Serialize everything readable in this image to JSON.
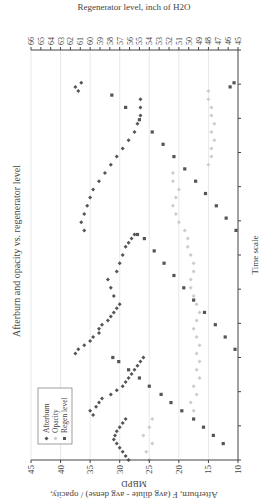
{
  "chart_data": {
    "type": "scatter",
    "title": "Afterburn and opacity vs. regenerator level",
    "xlabel": "Time scale",
    "ylabel": "Afterburn, F (avg dilute - avg dense) / opacity, MBPD",
    "y2label": "Regenerator level, inch of H2O",
    "ylim": [
      10,
      45
    ],
    "y_ticks": [
      10,
      15,
      20,
      25,
      30,
      35,
      40,
      45
    ],
    "y2lim": [
      45,
      66
    ],
    "y2_ticks": [
      45,
      46,
      47,
      48,
      49,
      50,
      51,
      52,
      53,
      54,
      55,
      56,
      57,
      58,
      59,
      60,
      61,
      62,
      63,
      64,
      65,
      66
    ],
    "xlim": [
      0,
      100
    ],
    "x_tick_count": 12,
    "grid": "vertical lines at left-axis ticks",
    "legend": {
      "position": "upper-left inside plot",
      "entries": [
        "Afterburn",
        "Opacity",
        "Regen level"
      ]
    },
    "rotation": "figure rotated 90 degrees counter-clockwise on page",
    "series": [
      {
        "name": "Afterburn",
        "axis": "left",
        "marker": "diamond",
        "color": "#555555",
        "points": [
          [
            0,
            28.5
          ],
          [
            1,
            29
          ],
          [
            2,
            29.5
          ],
          [
            3,
            30
          ],
          [
            4,
            30.5
          ],
          [
            5,
            31
          ],
          [
            6,
            30.8
          ],
          [
            7,
            30.5
          ],
          [
            8,
            30
          ],
          [
            9,
            29.5
          ],
          [
            10,
            29
          ],
          [
            11,
            34.5
          ],
          [
            12,
            35
          ],
          [
            13,
            34
          ],
          [
            14,
            33.5
          ],
          [
            15,
            33
          ],
          [
            16,
            31.5
          ],
          [
            17,
            30.5
          ],
          [
            18,
            29.5
          ],
          [
            19,
            29
          ],
          [
            20,
            28.5
          ],
          [
            21,
            28
          ],
          [
            22,
            27.5
          ],
          [
            23,
            27
          ],
          [
            24,
            26.5
          ],
          [
            25,
            26
          ],
          [
            26,
            37.5
          ],
          [
            27,
            37
          ],
          [
            28,
            36
          ],
          [
            29,
            35
          ],
          [
            30,
            34.5
          ],
          [
            31,
            33.5
          ],
          [
            32,
            33.5
          ],
          [
            33,
            33
          ],
          [
            34,
            32
          ],
          [
            35,
            31.5
          ],
          [
            36,
            31
          ],
          [
            37,
            30.5
          ],
          [
            38,
            30
          ],
          [
            40,
            31
          ],
          [
            42,
            31.5
          ],
          [
            44,
            32
          ],
          [
            46,
            30.5
          ],
          [
            48,
            30
          ],
          [
            50,
            29.5
          ],
          [
            52,
            29
          ],
          [
            53,
            28.5
          ],
          [
            54,
            28
          ],
          [
            55,
            27.5
          ],
          [
            56,
            36
          ],
          [
            58,
            36.5
          ],
          [
            60,
            36
          ],
          [
            62,
            35.5
          ],
          [
            64,
            35
          ],
          [
            66,
            34.5
          ],
          [
            68,
            33.5
          ],
          [
            70,
            32.5
          ],
          [
            72,
            31.5
          ],
          [
            74,
            30.5
          ],
          [
            76,
            29.5
          ],
          [
            78,
            28.5
          ],
          [
            80,
            27.5
          ],
          [
            82,
            27
          ],
          [
            84,
            26.5
          ],
          [
            86,
            26.5
          ],
          [
            88,
            26.5
          ],
          [
            90,
            37
          ],
          [
            91,
            37.5
          ],
          [
            92,
            36.5
          ]
        ]
      },
      {
        "name": "Opacity",
        "axis": "left",
        "marker": "diamond",
        "color": "#cccccc",
        "points": [
          [
            0,
            25
          ],
          [
            2,
            25.5
          ],
          [
            4,
            24.5
          ],
          [
            6,
            26
          ],
          [
            8,
            25
          ],
          [
            10,
            24.5
          ],
          [
            12,
            17.5
          ],
          [
            14,
            18
          ],
          [
            16,
            17
          ],
          [
            18,
            17.5
          ],
          [
            20,
            16.5
          ],
          [
            22,
            17
          ],
          [
            24,
            16.5
          ],
          [
            26,
            17
          ],
          [
            28,
            16.5
          ],
          [
            30,
            17
          ],
          [
            32,
            17.5
          ],
          [
            34,
            17
          ],
          [
            36,
            16.5
          ],
          [
            38,
            17
          ],
          [
            40,
            17.5
          ],
          [
            42,
            18
          ],
          [
            44,
            18
          ],
          [
            46,
            17.5
          ],
          [
            48,
            17.5
          ],
          [
            50,
            18
          ],
          [
            52,
            18.5
          ],
          [
            54,
            18.5
          ],
          [
            56,
            19
          ],
          [
            58,
            20
          ],
          [
            60,
            20.5
          ],
          [
            62,
            21
          ],
          [
            64,
            20.5
          ],
          [
            66,
            20
          ],
          [
            68,
            21
          ],
          [
            70,
            21
          ],
          [
            72,
            15
          ],
          [
            74,
            14.5
          ],
          [
            76,
            14.5
          ],
          [
            78,
            14
          ],
          [
            80,
            14.5
          ],
          [
            82,
            14
          ],
          [
            84,
            14.5
          ],
          [
            86,
            14.5
          ],
          [
            88,
            15
          ],
          [
            90,
            15
          ]
        ]
      },
      {
        "name": "Regen level",
        "axis": "right",
        "marker": "square",
        "color": "#555555",
        "points": [
          [
            4,
            46.5
          ],
          [
            6,
            47.5
          ],
          [
            8,
            48.5
          ],
          [
            10,
            49.5
          ],
          [
            12,
            50.7
          ],
          [
            14,
            51.8
          ],
          [
            16,
            52.8
          ],
          [
            18,
            54
          ],
          [
            20,
            55
          ],
          [
            22,
            56.1
          ],
          [
            24,
            57.1
          ],
          [
            25,
            57.7
          ],
          [
            27,
            45.3
          ],
          [
            30,
            46.3
          ],
          [
            33,
            47.3
          ],
          [
            36,
            48.4
          ],
          [
            39,
            49.5
          ],
          [
            42,
            50.5
          ],
          [
            45,
            51.5
          ],
          [
            48,
            52.5
          ],
          [
            51,
            53.5
          ],
          [
            54,
            54.5
          ],
          [
            55,
            55.2
          ],
          [
            56,
            45.2
          ],
          [
            59,
            46.2
          ],
          [
            62,
            47.2
          ],
          [
            65,
            48.3
          ],
          [
            68,
            49.3
          ],
          [
            71,
            50.4
          ],
          [
            74,
            51.5
          ],
          [
            77,
            52.6
          ],
          [
            80,
            53.7
          ],
          [
            83,
            55
          ],
          [
            86,
            56.4
          ],
          [
            89,
            57.8
          ],
          [
            91,
            45.8
          ],
          [
            92,
            45.4
          ]
        ]
      }
    ]
  }
}
